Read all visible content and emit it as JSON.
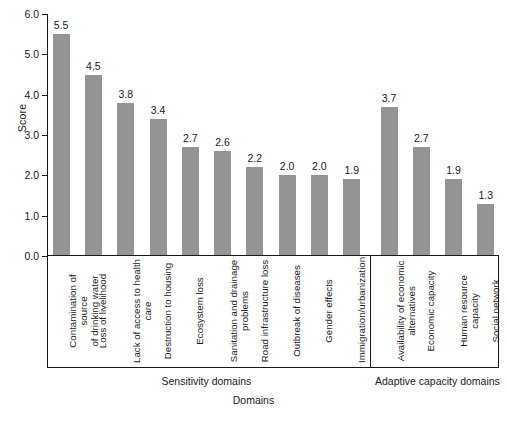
{
  "chart_data": {
    "type": "bar",
    "title": "",
    "xlabel": "Domains",
    "ylabel": "Score",
    "ylim": [
      0,
      6
    ],
    "yticks": [
      "0.0",
      "1.0",
      "2.0",
      "3.0",
      "4.0",
      "5.0",
      "6.0"
    ],
    "grid": false,
    "legend": null,
    "bar_color": "#949494",
    "categories": [
      "Contamination of source\nof drinking water",
      "Loss of livelihood",
      "Lack of access to health\ncare",
      "Destruction to housing",
      "Ecosystem loss",
      "Sanitation and drainage\nproblems",
      "Road infrastructure loss",
      "Outbreak of diseases",
      "Gender effects",
      "Immigration/urbanization",
      "Availability of economic\nalternatives",
      "Economic capacity",
      "Human resource capacity",
      "Social network"
    ],
    "values": [
      5.5,
      4.5,
      3.8,
      3.4,
      2.7,
      2.6,
      2.2,
      2.0,
      2.0,
      1.9,
      3.7,
      2.7,
      1.9,
      1.3
    ],
    "value_labels": [
      "5.5",
      "4.5",
      "3.8",
      "3.4",
      "2.7",
      "2.6",
      "2.2",
      "2.0",
      "2.0",
      "1.9",
      "3.7",
      "2.7",
      "1.9",
      "1.3"
    ],
    "groups": [
      {
        "label": "Sensitivity domains",
        "start": 0,
        "end": 9
      },
      {
        "label": "Adaptive capacity domains",
        "start": 10,
        "end": 13
      }
    ]
  }
}
